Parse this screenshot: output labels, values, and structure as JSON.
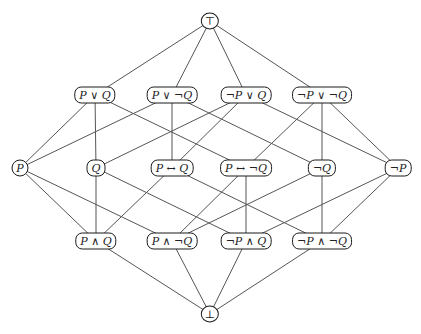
{
  "diagram": {
    "title": "",
    "type": "hasse-diagram",
    "stroke_color": "#555555",
    "node_border_color": "#1a1a1a",
    "nodes": [
      {
        "id": "top",
        "label": "⊤",
        "x": 210,
        "y": 21,
        "shape": "round"
      },
      {
        "id": "PorQ",
        "label": "P ∨ Q",
        "x": 95,
        "y": 95
      },
      {
        "id": "PorNQ",
        "label": "P ∨ ¬Q",
        "x": 172,
        "y": 95
      },
      {
        "id": "NPorQ",
        "label": "¬P ∨ Q",
        "x": 246,
        "y": 95
      },
      {
        "id": "NPorNQ",
        "label": "¬P ∨ ¬Q",
        "x": 322,
        "y": 95
      },
      {
        "id": "P",
        "label": "P",
        "x": 20,
        "y": 168,
        "shape": "round"
      },
      {
        "id": "Q",
        "label": "Q",
        "x": 96,
        "y": 168
      },
      {
        "id": "PiffQ",
        "label": "P ↔ Q",
        "x": 172,
        "y": 168
      },
      {
        "id": "PiffNQ",
        "label": "P ↔ ¬Q",
        "x": 246,
        "y": 168
      },
      {
        "id": "NQ",
        "label": "¬Q",
        "x": 322,
        "y": 168
      },
      {
        "id": "NP",
        "label": "¬P",
        "x": 398,
        "y": 168
      },
      {
        "id": "PandQ",
        "label": "P ∧ Q",
        "x": 96,
        "y": 241
      },
      {
        "id": "PandNQ",
        "label": "P ∧ ¬Q",
        "x": 172,
        "y": 241
      },
      {
        "id": "NPandQ",
        "label": "¬P ∧ Q",
        "x": 246,
        "y": 241
      },
      {
        "id": "NPandNQ",
        "label": "¬P ∧ ¬Q",
        "x": 322,
        "y": 241
      },
      {
        "id": "bot",
        "label": "⊥",
        "x": 210,
        "y": 314,
        "shape": "round"
      }
    ],
    "edges": [
      [
        "top",
        "PorQ"
      ],
      [
        "top",
        "PorNQ"
      ],
      [
        "top",
        "NPorQ"
      ],
      [
        "top",
        "NPorNQ"
      ],
      [
        "PorQ",
        "P"
      ],
      [
        "PorQ",
        "Q"
      ],
      [
        "PorQ",
        "PiffNQ"
      ],
      [
        "PorNQ",
        "P"
      ],
      [
        "PorNQ",
        "PiffQ"
      ],
      [
        "PorNQ",
        "NQ"
      ],
      [
        "NPorQ",
        "Q"
      ],
      [
        "NPorQ",
        "PiffQ"
      ],
      [
        "NPorQ",
        "NP"
      ],
      [
        "NPorNQ",
        "PiffNQ"
      ],
      [
        "NPorNQ",
        "NQ"
      ],
      [
        "NPorNQ",
        "NP"
      ],
      [
        "P",
        "PandQ"
      ],
      [
        "P",
        "PandNQ"
      ],
      [
        "Q",
        "PandQ"
      ],
      [
        "Q",
        "NPandQ"
      ],
      [
        "PiffQ",
        "PandQ"
      ],
      [
        "PiffQ",
        "NPandNQ"
      ],
      [
        "PiffNQ",
        "PandNQ"
      ],
      [
        "PiffNQ",
        "NPandQ"
      ],
      [
        "NQ",
        "PandNQ"
      ],
      [
        "NQ",
        "NPandNQ"
      ],
      [
        "NP",
        "NPandQ"
      ],
      [
        "NP",
        "NPandNQ"
      ],
      [
        "PandQ",
        "bot"
      ],
      [
        "PandNQ",
        "bot"
      ],
      [
        "NPandQ",
        "bot"
      ],
      [
        "NPandNQ",
        "bot"
      ]
    ]
  }
}
